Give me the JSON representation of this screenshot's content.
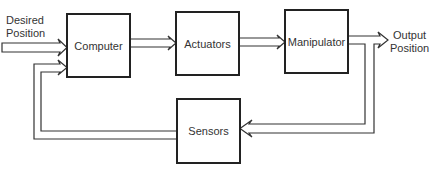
{
  "diagram": {
    "type": "block-diagram",
    "blocks": [
      {
        "id": "computer",
        "label": "Computer"
      },
      {
        "id": "actuators",
        "label": "Actuators"
      },
      {
        "id": "manipulator",
        "label": "Manipulator"
      },
      {
        "id": "sensors",
        "label": "Sensors"
      }
    ],
    "input": {
      "line1": "Desired",
      "line2": "Position"
    },
    "output": {
      "line1": "Output",
      "line2": "Position"
    },
    "edges": [
      {
        "from": "input",
        "to": "computer"
      },
      {
        "from": "computer",
        "to": "actuators"
      },
      {
        "from": "actuators",
        "to": "manipulator"
      },
      {
        "from": "manipulator",
        "to": "output"
      },
      {
        "from": "manipulator",
        "to": "sensors"
      },
      {
        "from": "sensors",
        "to": "computer"
      }
    ],
    "colors": {
      "stroke": "#222222",
      "background": "#ffffff"
    }
  }
}
